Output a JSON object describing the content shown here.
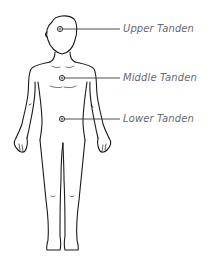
{
  "diagram": {
    "markers": [
      {
        "id": "upper",
        "label": "Upper Tanden",
        "x": 60,
        "y": 29
      },
      {
        "id": "middle",
        "label": "Middle Tanden",
        "x": 62,
        "y": 78
      },
      {
        "id": "lower",
        "label": "Lower Tanden",
        "x": 62,
        "y": 119
      }
    ],
    "colors": {
      "outline": "#1a1a1a",
      "leader_line": "#3a3a3a",
      "label_text": "#6a6a6a",
      "background": "#ffffff"
    }
  }
}
